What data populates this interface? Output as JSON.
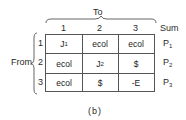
{
  "figure": {
    "caption": "(b)",
    "column_group_label": "To",
    "row_group_label": "From",
    "sum_label": "Sum",
    "columns": [
      "1",
      "2",
      "3"
    ],
    "rows": [
      {
        "label": "1",
        "cells": [
          {
            "main": "J",
            "sub": "1"
          },
          {
            "main": "ecol",
            "sub": ""
          },
          {
            "main": "ecol",
            "sub": ""
          }
        ],
        "sum": {
          "main": "P",
          "sub": "1"
        }
      },
      {
        "label": "2",
        "cells": [
          {
            "main": "ecol",
            "sub": ""
          },
          {
            "main": "J",
            "sub": "2"
          },
          {
            "main": "$",
            "sub": ""
          }
        ],
        "sum": {
          "main": "P",
          "sub": "2"
        }
      },
      {
        "label": "3",
        "cells": [
          {
            "main": "ecol",
            "sub": ""
          },
          {
            "main": "$",
            "sub": ""
          },
          {
            "main": "-E",
            "sub": ""
          }
        ],
        "sum": {
          "main": "P",
          "sub": "3"
        }
      }
    ]
  }
}
